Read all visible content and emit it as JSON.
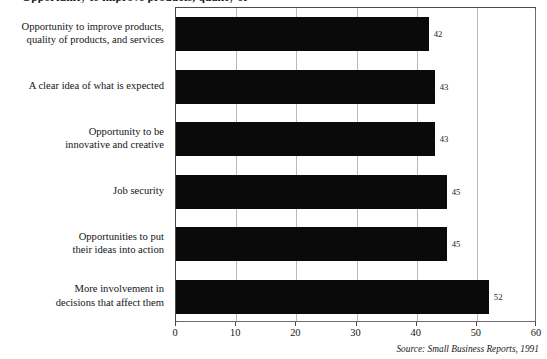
{
  "figure": {
    "title_sliver": "Opportunity to improve products, quality of",
    "source_note": "Source: Small Business Reports, 1991"
  },
  "chart_data": {
    "type": "bar",
    "orientation": "horizontal",
    "title": "",
    "xlabel": "",
    "ylabel": "",
    "xlim": [
      0,
      60
    ],
    "ylim": null,
    "grid": "vertical",
    "legend": null,
    "xticks": [
      0,
      10,
      20,
      30,
      40,
      50,
      60
    ],
    "xtick_labels": [
      "0",
      "10",
      "20",
      "30",
      "40",
      "50",
      "60"
    ],
    "bar_color": "#0a0a0a",
    "categories": [
      "Opportunity to improve products, quality of products, and services",
      "A clear idea of what is expected",
      "Opportunity to be innovative and creative",
      "Job security",
      "Opportunities to put their ideas into action",
      "More involvement in decisions that affect them"
    ],
    "category_lines": [
      [
        "Opportunity to improve products,",
        "quality of products, and services"
      ],
      [
        "A clear idea of what is expected"
      ],
      [
        "Opportunity to be",
        "innovative and creative"
      ],
      [
        "Job security"
      ],
      [
        "Opportunities to put",
        "their ideas into action"
      ],
      [
        "More involvement in",
        "decisions that affect them"
      ]
    ],
    "values": [
      42,
      43,
      43,
      45,
      45,
      52
    ],
    "value_labels": [
      "42",
      "43",
      "43",
      "45",
      "45",
      "52"
    ]
  }
}
